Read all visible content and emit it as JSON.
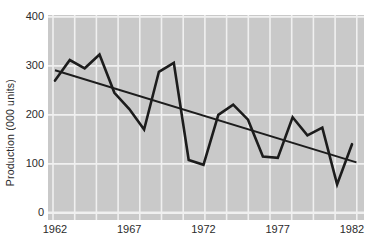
{
  "chart_data": {
    "type": "line",
    "title": "",
    "ylabel": "Production (000 units)",
    "xlabel": "",
    "x": [
      1962,
      1963,
      1964,
      1965,
      1966,
      1967,
      1968,
      1969,
      1970,
      1971,
      1972,
      1973,
      1974,
      1975,
      1976,
      1977,
      1978,
      1979,
      1980,
      1981,
      1982
    ],
    "series": [
      {
        "name": "Production",
        "values": [
          270,
          312,
          295,
          323,
          245,
          212,
          170,
          288,
          306,
          108,
          98,
          200,
          221,
          190,
          115,
          112,
          195,
          158,
          174,
          58,
          140
        ]
      },
      {
        "name": "Trend",
        "kind": "straight-line",
        "start": [
          1962,
          291
        ],
        "end": [
          1982.3,
          103
        ]
      }
    ],
    "xticks": [
      1962,
      1967,
      1972,
      1977,
      1982
    ],
    "yticks": [
      0,
      100,
      200,
      300,
      400
    ],
    "xlim": [
      1962,
      1982.9
    ],
    "ylim": [
      0,
      400
    ],
    "grid": true,
    "legend_position": "none",
    "colors": {
      "production_line": "#1c1c1c",
      "trend_line": "#1c1c1c",
      "plot_background": "#c9c9c9",
      "grid_line": "#f0f0f0",
      "tick_text": "#2b2b2b",
      "page_background": "#ffffff"
    }
  }
}
